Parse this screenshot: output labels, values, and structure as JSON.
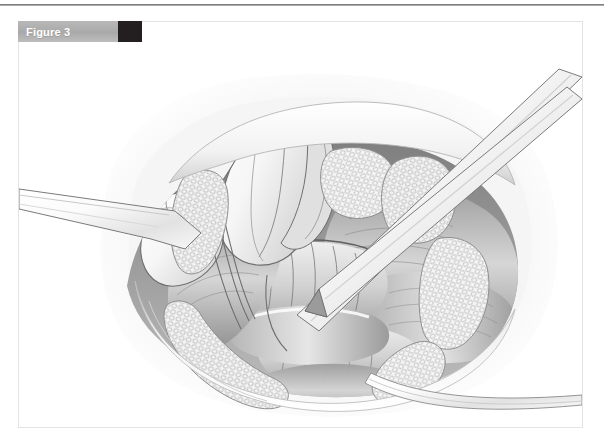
{
  "page": {
    "background_color": "#ffffff",
    "rule_color": "#7a7a7a",
    "card_border_color": "#e3e3e3"
  },
  "figure": {
    "label": "Figure 3",
    "label_band_color": "#b0b0b0",
    "label_text_color": "#ffffff",
    "swatch_color": "#231f20",
    "swatch_name": "figure-color-swatch"
  },
  "illustration": {
    "name": "surgical-anatomy-illustration",
    "style": "grayscale pen-and-ink medical illustration",
    "description": "Open surgical field of an anterior neck dissection with retracted skin edges, exposed larynx and trachea, strap muscles, fatty subcutaneous tissue at the wound margins, a retractor blade entering from the left, two crossing instrument shafts entering from the upper right, and a vessel loop exiting at the lower right.",
    "palette": {
      "line": "#4a4a4a",
      "mid_tone": "#b9b9b9",
      "shadow": "#8e8e8e",
      "highlight": "#ffffff",
      "halo": "#ededed"
    },
    "elements": [
      {
        "name": "wound-halo",
        "label": "soft tissue halo"
      },
      {
        "name": "skin-edge-upper",
        "label": "retracted upper skin edge"
      },
      {
        "name": "skin-edge-lower",
        "label": "retracted lower skin edge"
      },
      {
        "name": "fat-tissue-left",
        "label": "subcutaneous fat, left margin"
      },
      {
        "name": "fat-tissue-right",
        "label": "subcutaneous fat, right margin"
      },
      {
        "name": "fat-tissue-lower",
        "label": "subcutaneous fat, lower margin"
      },
      {
        "name": "thyroid-cartilage",
        "label": "thyroid cartilage / larynx"
      },
      {
        "name": "trachea",
        "label": "tracheal rings"
      },
      {
        "name": "strap-muscle-left",
        "label": "left strap muscle"
      },
      {
        "name": "strap-muscle-right",
        "label": "right strap muscle"
      },
      {
        "name": "vessel-band",
        "label": "vessel / nerve band"
      },
      {
        "name": "retractor-left",
        "label": "retractor blade, left"
      },
      {
        "name": "instrument-upper-right",
        "label": "instrument shaft, upper right"
      },
      {
        "name": "instrument-lower-right",
        "label": "forceps shaft, crossing"
      },
      {
        "name": "vessel-loop",
        "label": "vessel loop, lower right"
      }
    ]
  }
}
